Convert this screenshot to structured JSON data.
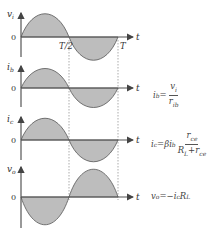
{
  "diagram": {
    "colors": {
      "fill": "#bdbdbd",
      "stroke": "#555555",
      "axis": "#555555",
      "guide": "#888888"
    },
    "time_labels": {
      "half_period": "T/2",
      "period": "T",
      "axis": "t"
    },
    "panels": [
      {
        "y_label": "vi",
        "y_label_main": "v",
        "y_label_sub": "i",
        "zero_label": "0",
        "phase": "in-phase"
      },
      {
        "y_label": "ib",
        "y_label_main": "i",
        "y_label_sub": "b",
        "zero_label": "0",
        "phase": "in-phase"
      },
      {
        "y_label": "ic",
        "y_label_main": "i",
        "y_label_sub": "c",
        "zero_label": "0",
        "phase": "in-phase"
      },
      {
        "y_label": "vo",
        "y_label_main": "v",
        "y_label_sub": "o",
        "zero_label": "0",
        "phase": "inverted"
      }
    ],
    "equations": {
      "ib": {
        "lhs": "i",
        "lhs_sub": "b",
        "eq": "=",
        "num": "v",
        "num_sub": "i",
        "den": "r",
        "den_sub": "ib"
      },
      "ic": {
        "lhs": "i",
        "lhs_sub": "c",
        "eq": "=βi",
        "mid_sub": "b",
        "num": "r",
        "num_sub": "ce",
        "den_a": "R",
        "den_a_sub": "L",
        "den_plus": "+r",
        "den_b_sub": "ce"
      },
      "vo": {
        "lhs": "v",
        "lhs_sub": "o",
        "eq": "=−i",
        "mid_sub": "c",
        "tail": "R",
        "tail_sub": "L"
      }
    }
  }
}
